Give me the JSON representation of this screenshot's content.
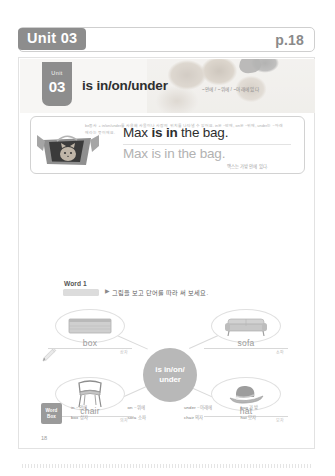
{
  "header": {
    "unit_label": "Unit 03",
    "page_label": "p.18"
  },
  "banner": {
    "unit_word": "Unit",
    "unit_number": "03",
    "title": "is in/on/under",
    "title_ko": "~안에 / ~위에 / ~아래에 있다"
  },
  "card": {
    "sentence_before": "Max ",
    "sentence_bold": "is in",
    "sentence_after": " the bag.",
    "sentence_trace": "Max is in the bag.",
    "sentence_ko": "맥스는 가방 안에 있다.",
    "note": "be동사 + in/on/under를 사용해 사물이나 사람의 위치를 나타낼 수 있어요.\nin은 ~안에, on은 ~위에, under는 ~아래에라는 뜻이에요.",
    "image_name": "cat-in-bag-photo"
  },
  "word1": {
    "section_label": "Word 1",
    "instruction": "그림을 보고 단어를 따라 써 보세요.",
    "arrow": "▶"
  },
  "map": {
    "hub_line1": "is in/on/",
    "hub_line2": "under",
    "nodes": [
      {
        "word": "box",
        "ko": "상자",
        "icon": "box-icon",
        "position": "top-left"
      },
      {
        "word": "sofa",
        "ko": "소파",
        "icon": "sofa-icon",
        "position": "top-right"
      },
      {
        "word": "chair",
        "ko": "의자",
        "icon": "chair-icon",
        "position": "bottom-left"
      },
      {
        "word": "hat",
        "ko": "모자",
        "icon": "hat-icon",
        "position": "bottom-right"
      }
    ]
  },
  "word_box": {
    "tag_line1": "Word",
    "tag_line2": "Box",
    "items": [
      {
        "en": "in",
        "ko": "~안에"
      },
      {
        "en": "on",
        "ko": "~위에"
      },
      {
        "en": "under",
        "ko": "~아래에"
      },
      {
        "en": "bag",
        "ko": "가방"
      },
      {
        "en": "box",
        "ko": "상자"
      },
      {
        "en": "sofa",
        "ko": "소파"
      },
      {
        "en": "chair",
        "ko": "의자"
      },
      {
        "en": "hat",
        "ko": "모자"
      }
    ]
  },
  "folio": "18",
  "colors": {
    "accent_gray": "#8d8d8d",
    "hub_gray": "#b8b8b8",
    "text_dark": "#2e2e2e",
    "text_muted": "#9d9d9d"
  }
}
